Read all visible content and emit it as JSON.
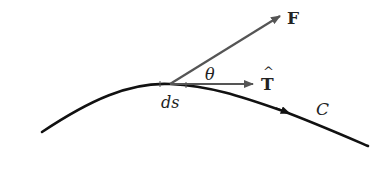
{
  "diagram": {
    "labels": {
      "force": "F",
      "tangent": "T",
      "tangent_hat": "^",
      "angle": "θ",
      "arc_element": "ds",
      "curve": "C"
    },
    "colors": {
      "curve": "#111111",
      "arrow": "#555555",
      "text": "#222222"
    }
  }
}
